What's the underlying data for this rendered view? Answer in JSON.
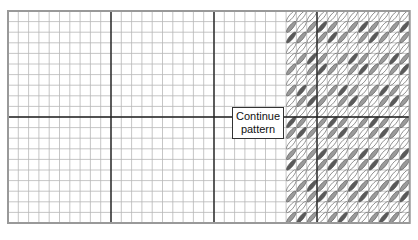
{
  "diagram": {
    "type": "needlepoint-stitch-chart",
    "grid": {
      "columns": 39,
      "rows": 20,
      "major_every": 10
    },
    "label": {
      "line1": "Continue",
      "line2": "pattern"
    },
    "stitch_colors": {
      "light": "#ffffff",
      "medium": "#9a9a9a",
      "dark": "#5a5a5a",
      "outline": "#555555"
    },
    "grid_colors": {
      "minor": "#b8b8b8",
      "major": "#222222",
      "border": "#999999"
    }
  }
}
